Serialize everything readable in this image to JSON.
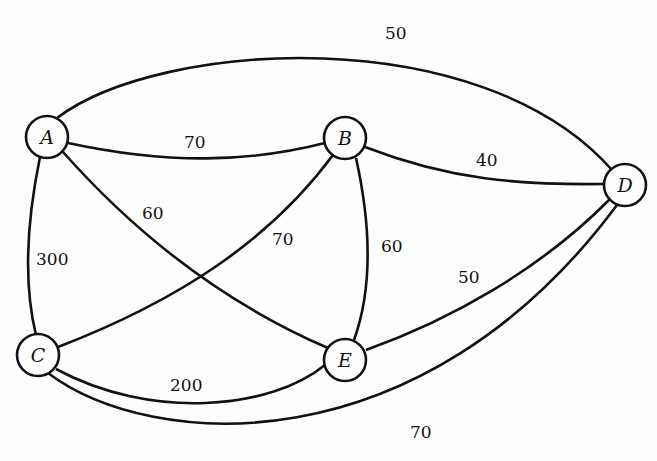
{
  "graph": {
    "nodes": [
      {
        "id": "A",
        "label": "A",
        "x": 47,
        "y": 137
      },
      {
        "id": "B",
        "label": "B",
        "x": 345,
        "y": 138
      },
      {
        "id": "C",
        "label": "C",
        "x": 38,
        "y": 355
      },
      {
        "id": "D",
        "label": "D",
        "x": 625,
        "y": 185
      },
      {
        "id": "E",
        "label": "E",
        "x": 345,
        "y": 360
      }
    ],
    "edges": [
      {
        "from": "A",
        "to": "D",
        "weight": "50"
      },
      {
        "from": "A",
        "to": "B",
        "weight": "70"
      },
      {
        "from": "A",
        "to": "E",
        "weight": "60"
      },
      {
        "from": "A",
        "to": "C",
        "weight": "300"
      },
      {
        "from": "B",
        "to": "D",
        "weight": "40"
      },
      {
        "from": "B",
        "to": "C",
        "weight": "70"
      },
      {
        "from": "B",
        "to": "E",
        "weight": "60"
      },
      {
        "from": "D",
        "to": "E",
        "weight": "50"
      },
      {
        "from": "C",
        "to": "E",
        "weight": "200"
      },
      {
        "from": "C",
        "to": "D",
        "weight": "70"
      }
    ]
  }
}
